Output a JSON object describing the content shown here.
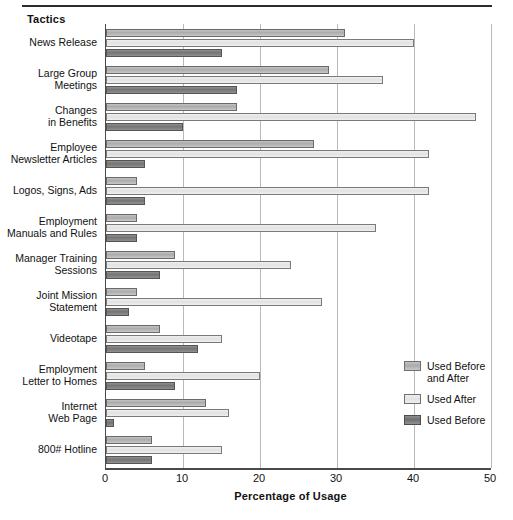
{
  "figure": {
    "group_axis_title": "Tactics",
    "legend_position": "right-lower"
  },
  "chart_data": {
    "type": "bar",
    "orientation": "horizontal",
    "title": "",
    "xlabel": "Percentage of Usage",
    "ylabel": "Tactics",
    "xlim": [
      0,
      50
    ],
    "xticks": [
      0,
      10,
      20,
      30,
      40,
      50
    ],
    "grid": true,
    "categories": [
      "News Release",
      "Large Group Meetings",
      "Changes in Benefits",
      "Employee Newsletter Articles",
      "Logos, Signs, Ads",
      "Employment Manuals and Rules",
      "Manager Training Sessions",
      "Joint Mission Statement",
      "Videotape",
      "Employment Letter to Homes",
      "Internet Web Page",
      "800# Hotline"
    ],
    "category_label_lines": [
      [
        "News Release"
      ],
      [
        "Large Group",
        "Meetings"
      ],
      [
        "Changes",
        "in Benefits"
      ],
      [
        "Employee",
        "Newsletter Articles"
      ],
      [
        "Logos, Signs, Ads"
      ],
      [
        "Employment",
        "Manuals and Rules"
      ],
      [
        "Manager Training",
        "Sessions"
      ],
      [
        "Joint Mission",
        "Statement"
      ],
      [
        "Videotape"
      ],
      [
        "Employment",
        "Letter to Homes"
      ],
      [
        "Internet",
        "Web Page"
      ],
      [
        "800# Hotline"
      ]
    ],
    "series": [
      {
        "name": "Used Before and After",
        "key": "before_after",
        "color": "#b4b4b4",
        "values": [
          31,
          29,
          17,
          27,
          4,
          4,
          9,
          4,
          7,
          5,
          13,
          6
        ]
      },
      {
        "name": "Used After",
        "key": "after",
        "color": "#e8e8e8",
        "values": [
          40,
          36,
          48,
          42,
          42,
          35,
          24,
          28,
          15,
          20,
          16,
          15
        ]
      },
      {
        "name": "Used Before",
        "key": "before",
        "color": "#787878",
        "values": [
          15,
          17,
          10,
          5,
          5,
          4,
          7,
          3,
          12,
          9,
          1,
          6
        ]
      }
    ]
  },
  "legend": {
    "items": [
      {
        "label_line1": "Used Before",
        "label_line2": "and After",
        "swatch": "sw-before-after"
      },
      {
        "label_line1": "Used After",
        "label_line2": "",
        "swatch": "sw-after"
      },
      {
        "label_line1": "Used Before",
        "label_line2": "",
        "swatch": "sw-before"
      }
    ]
  }
}
